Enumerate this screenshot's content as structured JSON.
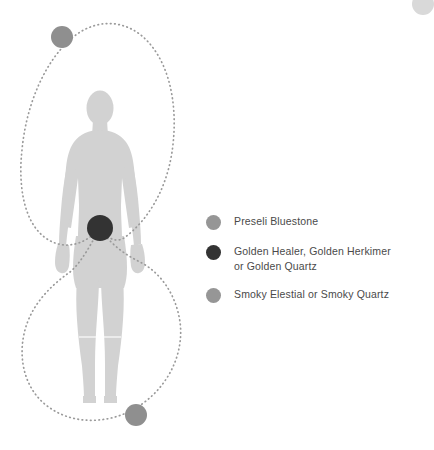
{
  "page": {
    "background_color": "#ffffff",
    "width": 426,
    "height": 450
  },
  "diagram": {
    "name": "crystal-body-layout-diagram",
    "figure": {
      "name": "human-body-silhouette",
      "fill_color": "#d2d2d2"
    },
    "energy_path": {
      "name": "figure-eight-energy-loop",
      "style": "dotted",
      "color": "#9a9a9a",
      "dot_radius": 0.85,
      "description": "Figure-eight loop crossing at the sacral point"
    },
    "placement_points": [
      {
        "name": "crown-crystal-point",
        "label": "Preseli Bluestone",
        "color": "#8f8f8f",
        "cx": 62,
        "cy": 37,
        "r": 11
      },
      {
        "name": "sacral-crystal-point",
        "label": "Golden Healer, Golden Herkimer or Golden Quartz",
        "color": "#333333",
        "cx": 100,
        "cy": 228,
        "r": 13
      },
      {
        "name": "earth-crystal-point",
        "label": "Smoky Elestial or Smoky Quartz",
        "color": "#8f8f8f",
        "cx": 136,
        "cy": 415,
        "r": 11
      }
    ]
  },
  "legend": {
    "name": "crystal-legend",
    "items": [
      {
        "swatch_name": "legend-swatch-preseli-bluestone",
        "color": "#969696",
        "label": "Preseli Bluestone"
      },
      {
        "swatch_name": "legend-swatch-golden-healer",
        "color": "#333333",
        "label": "Golden Healer, Golden Herkimer\nor Golden Quartz"
      },
      {
        "swatch_name": "legend-swatch-smoky-elestial",
        "color": "#969696",
        "label": "Smoky Elestial or Smoky Quartz"
      }
    ]
  },
  "corner": {
    "name": "corner-decoration",
    "color": "#d9d9d9"
  }
}
